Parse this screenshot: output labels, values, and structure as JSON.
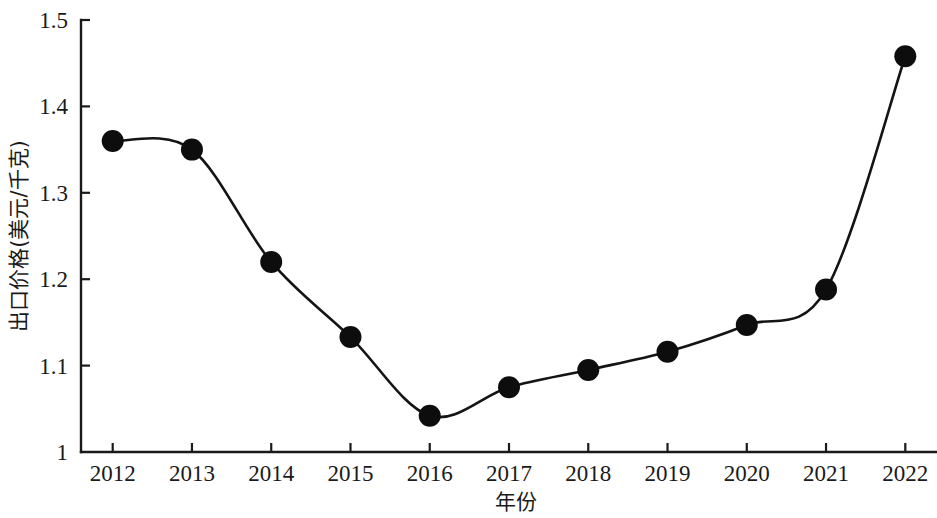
{
  "chart_data": {
    "type": "line",
    "title": "",
    "subtitle": "",
    "xlabel": "年份",
    "ylabel": "出口价格(美元/千克)",
    "x": [
      2012,
      2013,
      2014,
      2015,
      2016,
      2017,
      2018,
      2019,
      2020,
      2021,
      2022
    ],
    "categories": [
      "2012",
      "2013",
      "2014",
      "2015",
      "2016",
      "2017",
      "2018",
      "2019",
      "2020",
      "2021",
      "2022"
    ],
    "values": [
      1.36,
      1.35,
      1.22,
      1.133,
      1.042,
      1.075,
      1.095,
      1.116,
      1.147,
      1.188,
      1.458
    ],
    "series": [
      {
        "name": "出口价格",
        "values": [
          1.36,
          1.35,
          1.22,
          1.133,
          1.042,
          1.075,
          1.095,
          1.116,
          1.147,
          1.188,
          1.458
        ]
      }
    ],
    "ylim": [
      1.0,
      1.5
    ],
    "xlim": [
      2011.6,
      2022.4
    ],
    "ytick_labels": [
      "1",
      "1.1",
      "1.2",
      "1.3",
      "1.4",
      "1.5"
    ],
    "ytick_values": [
      1.0,
      1.1,
      1.2,
      1.3,
      1.4,
      1.5
    ],
    "xtick_labels": [
      "2012",
      "2013",
      "2014",
      "2015",
      "2016",
      "2017",
      "2018",
      "2019",
      "2020",
      "2021",
      "2022"
    ],
    "grid": false,
    "legend": false,
    "legend_position": "none",
    "marker": "filled-circle",
    "line_color": "#141414",
    "marker_color": "#0d0d0d",
    "background_color": "#ffffff",
    "annotations": []
  },
  "axes": {
    "y_title": "出口价格(美元/千克)",
    "x_title": "年份",
    "y_ticks": [
      {
        "label": "1.5",
        "value": 1.5
      },
      {
        "label": "1.4",
        "value": 1.4
      },
      {
        "label": "1.3",
        "value": 1.3
      },
      {
        "label": "1.2",
        "value": 1.2
      },
      {
        "label": "1.1",
        "value": 1.1
      },
      {
        "label": "1",
        "value": 1.0
      }
    ],
    "x_ticks": [
      {
        "label": "2012",
        "value": 2012
      },
      {
        "label": "2013",
        "value": 2013
      },
      {
        "label": "2014",
        "value": 2014
      },
      {
        "label": "2015",
        "value": 2015
      },
      {
        "label": "2016",
        "value": 2016
      },
      {
        "label": "2017",
        "value": 2017
      },
      {
        "label": "2018",
        "value": 2018
      },
      {
        "label": "2019",
        "value": 2019
      },
      {
        "label": "2020",
        "value": 2020
      },
      {
        "label": "2021",
        "value": 2021
      },
      {
        "label": "2022",
        "value": 2022
      }
    ]
  }
}
